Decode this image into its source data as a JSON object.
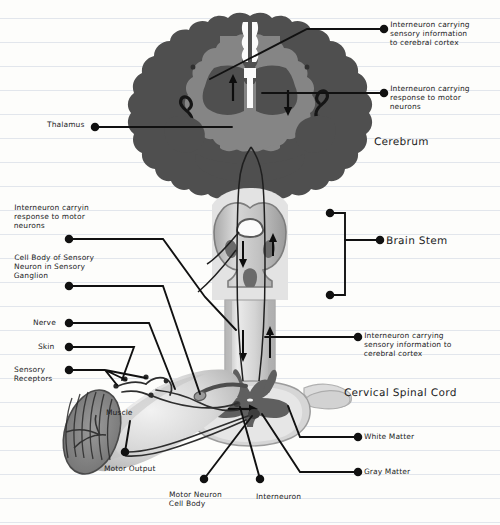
{
  "document": {
    "kind": "hand-drawn-diagram",
    "medium": "ruled notebook paper",
    "subject": "Reflex arc: brain, brain stem and cervical spinal cord",
    "paper_color": "#fdfdfb",
    "rule_color": "#e2e6ec",
    "ink_color": "#1b1b1b",
    "rule_spacing_px": 24,
    "rule_first_y": 18
  },
  "palette": {
    "cortex_dark_gray": "#4f4f4f",
    "brain_mid_gray": "#858585",
    "brain_stem_fill": "#b9b9b9",
    "brain_stem_edge": "#7d7d7d",
    "cord_white_matter": "#d2d2d2",
    "cord_gray_matter": "#6a6a6a",
    "limb_skin": "#cfcfcf",
    "muscle_fill": "#8a8a8a",
    "nerve_stroke": "#3a3a3a",
    "ink": "#1b1b1b"
  },
  "labels": [
    {
      "id": "interneuron-sensory-cortex-top",
      "text": "Interneuron carrying\nsensory information\nto cerebral cortex",
      "x": 390,
      "y": 20,
      "dot": {
        "x": 384,
        "y": 29
      },
      "size": "small",
      "align": "left"
    },
    {
      "id": "interneuron-motor-response-top",
      "text": "Interneuron carrying\nresponse to motor\nneurons",
      "x": 390,
      "y": 84,
      "dot": {
        "x": 384,
        "y": 93
      },
      "size": "small",
      "align": "left"
    },
    {
      "id": "thalamus",
      "text": "Thalamus",
      "x": 47,
      "y": 120,
      "dot": {
        "x": 95,
        "y": 127
      },
      "size": "small",
      "align": "left"
    },
    {
      "id": "cerebrum",
      "text": "Cerebrum",
      "x": 374,
      "y": 135,
      "dot": null,
      "size": "big",
      "align": "left"
    },
    {
      "id": "brain-stem",
      "text": "Brain Stem",
      "x": 386,
      "y": 234,
      "dot": {
        "x": 380,
        "y": 240
      },
      "size": "big",
      "align": "left"
    },
    {
      "id": "interneuron-motor-response-left",
      "text": "Interneuron carryin\nresponse to motor\nneurons",
      "x": 14,
      "y": 203,
      "dot": {
        "x": 69,
        "y": 239
      },
      "size": "small",
      "align": "left"
    },
    {
      "id": "cell-body-sensory-neuron",
      "text": "Cell Body of Sensory\nNeuron in Sensory\nGanglion",
      "x": 14,
      "y": 253,
      "dot": {
        "x": 69,
        "y": 286
      },
      "size": "small",
      "align": "left"
    },
    {
      "id": "nerve",
      "text": "Nerve",
      "x": 33,
      "y": 318,
      "dot": {
        "x": 69,
        "y": 323
      },
      "size": "small",
      "align": "left"
    },
    {
      "id": "skin",
      "text": "Skin",
      "x": 38,
      "y": 342,
      "dot": {
        "x": 69,
        "y": 347
      },
      "size": "small",
      "align": "left"
    },
    {
      "id": "sensory-receptors",
      "text": "Sensory\nReceptors",
      "x": 14,
      "y": 365,
      "dot": {
        "x": 69,
        "y": 370
      },
      "size": "small",
      "align": "left"
    },
    {
      "id": "muscle",
      "text": "Muscle",
      "x": 106,
      "y": 408,
      "dot": null,
      "size": "small",
      "align": "left"
    },
    {
      "id": "motor-output",
      "text": "Motor Output",
      "x": 104,
      "y": 464,
      "dot": {
        "x": 125,
        "y": 452
      },
      "size": "small",
      "align": "left"
    },
    {
      "id": "motor-neuron-cell-body",
      "text": "Motor Neuron\nCell Body",
      "x": 169,
      "y": 490,
      "dot": {
        "x": 204,
        "y": 479
      },
      "size": "small",
      "align": "left"
    },
    {
      "id": "interneuron-bottom",
      "text": "Interneuron",
      "x": 256,
      "y": 492,
      "dot": {
        "x": 260,
        "y": 479
      },
      "size": "small",
      "align": "left"
    },
    {
      "id": "interneuron-sensory-cortex-cord",
      "text": "Interneuron carrying\nsensory information to\ncerebral cortex",
      "x": 364,
      "y": 331,
      "dot": {
        "x": 358,
        "y": 337
      },
      "size": "small",
      "align": "left"
    },
    {
      "id": "cervical-spinal-cord",
      "text": "Cervical Spinal Cord",
      "x": 344,
      "y": 386,
      "dot": null,
      "size": "big",
      "align": "left"
    },
    {
      "id": "white-matter",
      "text": "White Matter",
      "x": 364,
      "y": 432,
      "dot": {
        "x": 358,
        "y": 437
      },
      "size": "small",
      "align": "left"
    },
    {
      "id": "gray-matter",
      "text": "Gray Matter",
      "x": 364,
      "y": 467,
      "dot": {
        "x": 358,
        "y": 472
      },
      "size": "small",
      "align": "left"
    }
  ],
  "anatomy_parts": [
    {
      "id": "cerebrum",
      "name": "Cerebrum (coronal section)"
    },
    {
      "id": "cerebral-cortex",
      "name": "Cerebral cortex (dark gray band)"
    },
    {
      "id": "thalamus",
      "name": "Thalamus"
    },
    {
      "id": "lateral-ventricles",
      "name": "Lateral ventricles"
    },
    {
      "id": "brain-stem",
      "name": "Brain stem"
    },
    {
      "id": "cervical-spinal-cord",
      "name": "Cervical spinal cord"
    },
    {
      "id": "spinal-cord-cross-section",
      "name": "Spinal cord cross-section"
    },
    {
      "id": "gray-matter",
      "name": "Gray matter (butterfly)"
    },
    {
      "id": "white-matter",
      "name": "White matter"
    },
    {
      "id": "dorsal-root-ganglion",
      "name": "Dorsal root ganglion"
    },
    {
      "id": "peripheral-nerve",
      "name": "Peripheral nerve"
    },
    {
      "id": "skin-limb",
      "name": "Skin / limb"
    },
    {
      "id": "muscle",
      "name": "Skeletal muscle with striations"
    },
    {
      "id": "sensory-receptors",
      "name": "Sensory receptors"
    }
  ],
  "arrows": [
    {
      "id": "arrow-cortex-up-left",
      "dir": "up",
      "note": "ascending sensory in left hemisphere"
    },
    {
      "id": "arrow-cortex-down-right",
      "dir": "down",
      "note": "descending motor in right hemisphere"
    },
    {
      "id": "arrow-stem-down",
      "dir": "down",
      "note": "descending motor in brain stem"
    },
    {
      "id": "arrow-stem-up",
      "dir": "up",
      "note": "ascending sensory in brain stem"
    },
    {
      "id": "arrow-cord-down",
      "dir": "down",
      "note": "descending motor in cord"
    },
    {
      "id": "arrow-cord-up",
      "dir": "up",
      "note": "ascending sensory in cord"
    },
    {
      "id": "arrow-synapse-right",
      "dir": "right",
      "note": "synapse onto motor neuron"
    }
  ]
}
